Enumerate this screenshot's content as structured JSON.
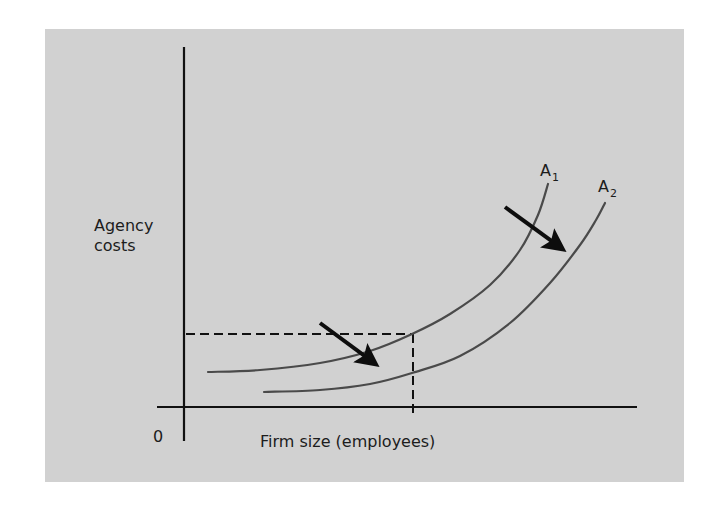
{
  "chart_data": {
    "type": "line",
    "title": "",
    "xlabel": "Firm size (employees)",
    "ylabel": "Agency costs",
    "ylabel_lines": [
      "Agency",
      "costs"
    ],
    "origin_label": "0",
    "grid": false,
    "legend": "inline curve labels",
    "series": [
      {
        "name": "A1",
        "label_main": "A",
        "label_sub": "1",
        "description": "Agency cost curve (before shift)",
        "points_px": [
          [
            208,
            372
          ],
          [
            260,
            370
          ],
          [
            320,
            363
          ],
          [
            370,
            351
          ],
          [
            412,
            334
          ],
          [
            450,
            314
          ],
          [
            490,
            285
          ],
          [
            520,
            250
          ],
          [
            538,
            215
          ],
          [
            548,
            184
          ]
        ]
      },
      {
        "name": "A2",
        "label_main": "A",
        "label_sub": "2",
        "description": "Agency cost curve (after downward/rightward shift)",
        "points_px": [
          [
            264,
            392
          ],
          [
            320,
            390
          ],
          [
            370,
            384
          ],
          [
            412,
            373
          ],
          [
            460,
            356
          ],
          [
            510,
            323
          ],
          [
            550,
            283
          ],
          [
            580,
            245
          ],
          [
            596,
            220
          ],
          [
            605,
            203
          ]
        ]
      }
    ],
    "annotations": [
      {
        "type": "dashed-line",
        "orientation": "horizontal",
        "from_px": [
          186,
          334
        ],
        "to_px": [
          412,
          334
        ],
        "meaning": "agency cost level at reference firm size on A1"
      },
      {
        "type": "dashed-line",
        "orientation": "vertical",
        "from_px": [
          412,
          334
        ],
        "to_px": [
          412,
          417
        ],
        "meaning": "reference firm size"
      },
      {
        "type": "arrow",
        "from_px": [
          320,
          323
        ],
        "to_px": [
          385,
          371
        ],
        "meaning": "shift from A1 to A2"
      },
      {
        "type": "arrow",
        "from_px": [
          505,
          207
        ],
        "to_px": [
          572,
          256
        ],
        "meaning": "shift from A1 to A2"
      }
    ],
    "axes": {
      "x_axis_px": {
        "from": [
          157,
          407
        ],
        "to": [
          637,
          407
        ]
      },
      "y_axis_px": {
        "from": [
          184,
          47
        ],
        "to": [
          184,
          441
        ]
      }
    }
  },
  "colors": {
    "panel_background": "#d1d1d1",
    "page_background": "#ffffff",
    "axis": "#111111",
    "curve": "#4a4a4a",
    "arrow": "#0d0d0d",
    "text": "#1c1c1c"
  }
}
